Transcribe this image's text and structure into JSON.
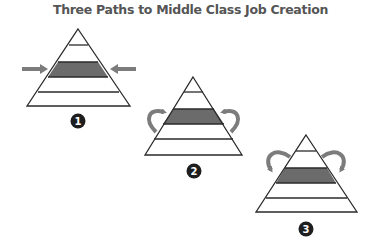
{
  "title": "Three Paths to Middle Class Job Creation",
  "colors": {
    "outline": "#2a2a2a",
    "band": "#6b6b6b",
    "arrow": "#7c7c7c",
    "badge": "#1e1e1e",
    "title": "#555555"
  },
  "paths": [
    {
      "number": "1",
      "arrow_style": "straight-inward",
      "highlighted_tier": "middle"
    },
    {
      "number": "2",
      "arrow_style": "curved-up-from-below",
      "highlighted_tier": "middle"
    },
    {
      "number": "3",
      "arrow_style": "curved-down-from-above",
      "highlighted_tier": "middle"
    }
  ]
}
